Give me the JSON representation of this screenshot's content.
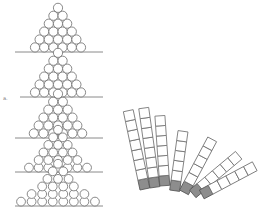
{
  "figure": {
    "width": 274,
    "height": 222,
    "background": "#ffffff",
    "ink_color": "#6b6b6b",
    "shade_color": "#8d8d8d",
    "margin_mark": "a.",
    "ball_piles": [
      {
        "id": "pile-1",
        "baseline_y": 52,
        "line_x1": 15,
        "line_x2": 103,
        "center_x": 58,
        "rows": [
          1,
          2,
          3,
          4,
          5,
          6
        ],
        "radius": 4.6,
        "spread": 1.0
      },
      {
        "id": "pile-2",
        "baseline_y": 97,
        "line_x1": 20,
        "line_x2": 103,
        "center_x": 58,
        "rows": [
          1,
          2,
          3,
          4,
          5,
          6
        ],
        "radius": 4.6,
        "spread": 1.0
      },
      {
        "id": "pile-3",
        "baseline_y": 138,
        "line_x1": 15,
        "line_x2": 103,
        "center_x": 58,
        "rows": [
          1,
          2,
          3,
          4,
          5,
          6
        ],
        "radius": 4.6,
        "spread": 1.05
      },
      {
        "id": "pile-4",
        "baseline_y": 172,
        "line_x1": 15,
        "line_x2": 103,
        "center_x": 58,
        "rows": [
          1,
          2,
          3,
          4,
          5,
          7
        ],
        "radius": 4.4,
        "spread": 1.1
      },
      {
        "id": "pile-5",
        "baseline_y": 206,
        "line_x1": 15,
        "line_x2": 103,
        "center_x": 58,
        "rows": [
          1,
          2,
          3,
          4,
          6,
          8
        ],
        "radius": 4.4,
        "spread": 1.2
      }
    ],
    "square_fan": {
      "pivot_x": 140,
      "pivot_y": 200,
      "square_size": 10,
      "columns": [
        {
          "angle": -12,
          "offset": 0,
          "count": 8,
          "shaded_bottom": 1
        },
        {
          "angle": -8,
          "offset": 11,
          "count": 8,
          "shaded_bottom": 1
        },
        {
          "angle": -4,
          "offset": 22,
          "count": 7,
          "shaded_bottom": 1
        },
        {
          "angle": 8,
          "offset": 33,
          "count": 6,
          "shaded_bottom": 1
        },
        {
          "angle": 28,
          "offset": 44,
          "count": 6,
          "shaded_bottom": 1
        },
        {
          "angle": 50,
          "offset": 55,
          "count": 6,
          "shaded_bottom": 1
        },
        {
          "angle": 62,
          "offset": 66,
          "count": 6,
          "shaded_bottom": 1
        }
      ]
    }
  }
}
